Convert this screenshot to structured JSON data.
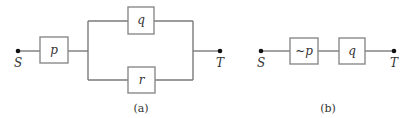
{
  "diagram_a": {
    "caption": "(a)",
    "start_label": "S",
    "end_label": "T",
    "series_switch": "p",
    "parallel_top_switch": "q",
    "parallel_bottom_switch": "r"
  },
  "diagram_b": {
    "caption": "(b)",
    "start_label": "S",
    "end_label": "T",
    "first_switch": "~p",
    "second_switch": "q"
  },
  "colors": {
    "wire": "#7a7a7a",
    "box_border": "#8a8a8a",
    "terminal": "#111111",
    "text": "#333333"
  }
}
